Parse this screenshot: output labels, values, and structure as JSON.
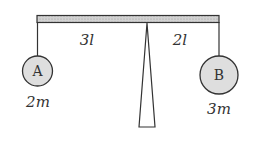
{
  "diagram": {
    "type": "lever-balance",
    "left_arm_label": "3l",
    "right_arm_label": "2l",
    "left_mass": {
      "name": "A",
      "mass_label": "2m"
    },
    "right_mass": {
      "name": "B",
      "mass_label": "3m"
    },
    "colors": {
      "bar_fill": "#c8c8c8",
      "ball_fill": "#dedede",
      "stroke": "#333333"
    }
  }
}
